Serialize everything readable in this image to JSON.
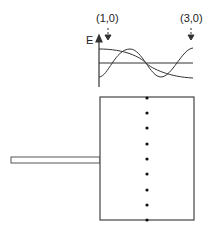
{
  "diagram": {
    "labels": {
      "marker_left": "(1,0)",
      "marker_right": "(3,0)",
      "axis_y": "E"
    },
    "waves": [
      "mode (1,0)",
      "mode (3,0)",
      "baseline"
    ],
    "plate": {
      "dot_count": 9
    },
    "colors": {
      "stroke": "#333333",
      "background": "#ffffff"
    }
  }
}
